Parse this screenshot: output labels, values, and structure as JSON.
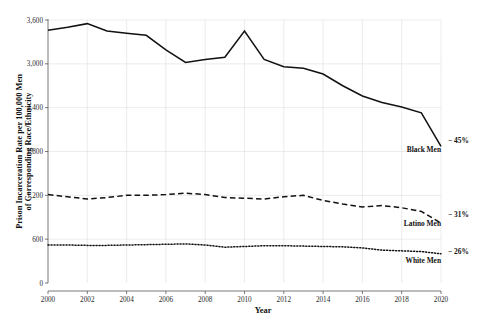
{
  "chart_data": {
    "type": "line",
    "title": "",
    "xlabel": "Year",
    "ylabel": "Prison Incarceration Rate per 100,000 Men of Corresponding Race/Ethnicity",
    "ylabel_line1": "Prison Incarceration Rate per 100,000 Men",
    "ylabel_line2": "of Corresponding Race/Ethnicity",
    "xlim": [
      2000,
      2020
    ],
    "ylim": [
      0,
      3600
    ],
    "grid": true,
    "legend_position": "inline-right",
    "x": [
      2000,
      2001,
      2002,
      2003,
      2004,
      2005,
      2006,
      2007,
      2008,
      2009,
      2010,
      2011,
      2012,
      2013,
      2014,
      2015,
      2016,
      2017,
      2018,
      2019,
      2020
    ],
    "xticks": [
      "2000",
      "2002",
      "2004",
      "2006",
      "2008",
      "2010",
      "2012",
      "2014",
      "2016",
      "2018",
      "2020"
    ],
    "xtick_values": [
      2000,
      2002,
      2004,
      2006,
      2008,
      2010,
      2012,
      2014,
      2016,
      2018,
      2020
    ],
    "yticks": [
      "0",
      "600",
      "1,200",
      "1,800",
      "2,400",
      "3,000",
      "3,600"
    ],
    "ytick_values": [
      0,
      600,
      1200,
      1800,
      2400,
      3000,
      3600
    ],
    "series": [
      {
        "name": "Black Men",
        "label": "Black Men",
        "delta": "− 45%",
        "style": "solid",
        "color": "#111111",
        "values": [
          3460,
          3500,
          3550,
          3450,
          3420,
          3390,
          3190,
          3020,
          3060,
          3090,
          3450,
          3060,
          2960,
          2940,
          2860,
          2700,
          2560,
          2470,
          2410,
          2330,
          1870
        ]
      },
      {
        "name": "Latino Men",
        "label": "Latino Men",
        "delta": "− 31%",
        "style": "dashed",
        "color": "#111111",
        "values": [
          1210,
          1180,
          1150,
          1170,
          1200,
          1200,
          1210,
          1230,
          1210,
          1170,
          1160,
          1150,
          1180,
          1200,
          1130,
          1080,
          1040,
          1060,
          1030,
          980,
          820
        ]
      },
      {
        "name": "White Men",
        "label": "White Men",
        "delta": "− 26%",
        "style": "dotted",
        "color": "#111111",
        "values": [
          520,
          520,
          515,
          515,
          520,
          525,
          530,
          535,
          520,
          490,
          500,
          510,
          510,
          505,
          500,
          495,
          480,
          450,
          440,
          430,
          400
        ]
      }
    ]
  }
}
